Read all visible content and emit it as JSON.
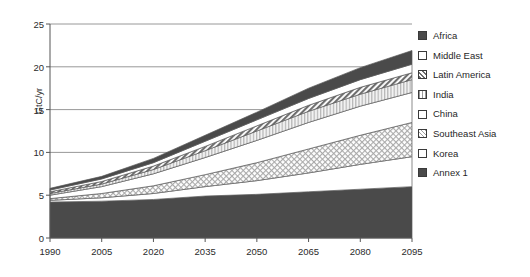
{
  "chart_data": {
    "type": "area",
    "stacked": true,
    "title": "",
    "xlabel": "",
    "ylabel": "GtC/yr",
    "x": [
      1990,
      2005,
      2020,
      2035,
      2050,
      2065,
      2080,
      2095
    ],
    "xlim": [
      1990,
      2095
    ],
    "ylim": [
      0,
      25
    ],
    "yticks": [
      0,
      5,
      10,
      15,
      20,
      25
    ],
    "xticks": [
      1990,
      2005,
      2020,
      2035,
      2050,
      2065,
      2080,
      2095
    ],
    "grid": "horizontal",
    "legend_position": "right",
    "series": [
      {
        "name": "Annex 1",
        "fill": "solid-dark",
        "color": "#4a4a4a",
        "values": [
          4.2,
          4.3,
          4.5,
          4.9,
          5.1,
          5.4,
          5.7,
          6.0
        ]
      },
      {
        "name": "Korea",
        "fill": "white",
        "color": "#ffffff",
        "values": [
          0.2,
          0.4,
          0.7,
          1.1,
          1.6,
          2.2,
          2.9,
          3.5
        ]
      },
      {
        "name": "Southeast Asia",
        "fill": "cross-hatch",
        "color": "#d8d8d8",
        "values": [
          0.2,
          0.5,
          0.9,
          1.4,
          2.1,
          2.8,
          3.4,
          4.0
        ]
      },
      {
        "name": "China",
        "fill": "white",
        "color": "#ffffff",
        "values": [
          0.4,
          0.8,
          1.4,
          2.0,
          2.6,
          3.1,
          3.4,
          3.5
        ]
      },
      {
        "name": "India",
        "fill": "vertical",
        "color": "#cfcfcf",
        "values": [
          0.2,
          0.3,
          0.5,
          0.8,
          1.1,
          1.3,
          1.4,
          1.5
        ]
      },
      {
        "name": "Latin America",
        "fill": "diagonal",
        "color": "#9a9a9a",
        "values": [
          0.2,
          0.3,
          0.4,
          0.5,
          0.6,
          0.7,
          0.8,
          0.8
        ]
      },
      {
        "name": "Middle East",
        "fill": "white",
        "color": "#ffffff",
        "values": [
          0.2,
          0.3,
          0.4,
          0.6,
          0.7,
          0.8,
          0.9,
          1.0
        ]
      },
      {
        "name": "Africa",
        "fill": "solid-dark",
        "color": "#4a4a4a",
        "values": [
          0.2,
          0.3,
          0.5,
          0.7,
          0.9,
          1.2,
          1.4,
          1.6
        ]
      }
    ],
    "cumulative_tops": {
      "Annex 1": [
        4.2,
        4.3,
        4.5,
        4.9,
        5.1,
        5.4,
        5.7,
        6.0
      ],
      "Korea": [
        4.4,
        4.7,
        5.2,
        6.0,
        6.7,
        7.6,
        8.6,
        9.5
      ],
      "Southeast Asia": [
        4.6,
        5.2,
        6.1,
        7.4,
        8.8,
        10.4,
        12.0,
        13.5
      ],
      "China": [
        5.0,
        6.0,
        7.5,
        9.4,
        11.4,
        13.5,
        15.4,
        17.0
      ],
      "India": [
        5.2,
        6.3,
        8.0,
        10.2,
        12.5,
        14.8,
        16.8,
        18.5
      ],
      "Latin America": [
        5.4,
        6.6,
        8.4,
        10.7,
        13.1,
        15.5,
        17.6,
        19.3
      ],
      "Middle East": [
        5.6,
        6.9,
        8.8,
        11.3,
        13.8,
        16.3,
        18.5,
        20.3
      ],
      "Africa": [
        5.8,
        7.2,
        9.3,
        12.0,
        14.7,
        17.5,
        19.9,
        21.9
      ]
    }
  },
  "axes": {
    "ylabel": "GtC/yr",
    "ytick_labels": [
      "25",
      "20",
      "15",
      "10",
      "5",
      "0"
    ],
    "xtick_labels": [
      "1990",
      "2005",
      "2020",
      "2035",
      "2050",
      "2065",
      "2080",
      "2095"
    ]
  },
  "legend": {
    "items": [
      {
        "label": "Africa",
        "pattern": "solid-dark"
      },
      {
        "label": "Middle East",
        "pattern": "white"
      },
      {
        "label": "Latin America",
        "pattern": "diagonal"
      },
      {
        "label": "India",
        "pattern": "vertical"
      },
      {
        "label": "China",
        "pattern": "white"
      },
      {
        "label": "Southeast Asia",
        "pattern": "cross-hatch"
      },
      {
        "label": "Korea",
        "pattern": "white"
      },
      {
        "label": "Annex 1",
        "pattern": "solid-dark"
      }
    ]
  },
  "colors": {
    "dark": "#4a4a4a",
    "mid": "#9a9a9a",
    "light": "#d8d8d8",
    "white": "#ffffff",
    "axis": "#555555",
    "grid": "#7d7d7d",
    "text": "#1f1f1f"
  }
}
